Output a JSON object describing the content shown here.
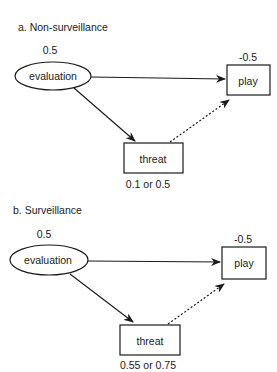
{
  "panels": [
    {
      "title": "a. Non-surveillance",
      "evaluation": {
        "label": "evaluation",
        "value": "0.5"
      },
      "play": {
        "label": "play",
        "value": "-0.5"
      },
      "threat": {
        "label": "threat",
        "value": "0.1 or 0.5"
      },
      "edges": [
        {
          "from": "evaluation",
          "to": "play",
          "style": "solid"
        },
        {
          "from": "evaluation",
          "to": "threat",
          "style": "solid"
        },
        {
          "from": "threat",
          "to": "play",
          "style": "dashed"
        }
      ]
    },
    {
      "title": "b. Surveillance",
      "evaluation": {
        "label": "evaluation",
        "value": "0.5"
      },
      "play": {
        "label": "play",
        "value": "-0.5"
      },
      "threat": {
        "label": "threat",
        "value": "0.55 or 0.75"
      },
      "edges": [
        {
          "from": "evaluation",
          "to": "play",
          "style": "solid"
        },
        {
          "from": "evaluation",
          "to": "threat",
          "style": "solid"
        },
        {
          "from": "threat",
          "to": "play",
          "style": "dashed"
        }
      ]
    }
  ],
  "colors": {
    "ink": "#1a1a1a",
    "background": "#ffffff"
  }
}
